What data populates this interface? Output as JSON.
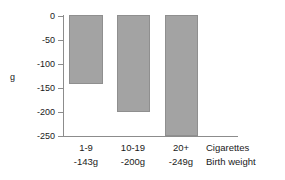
{
  "chart_data": {
    "type": "bar",
    "title": "",
    "xlabel": "Cigarettes",
    "ylabel": "g",
    "categories": [
      "1-9",
      "10-19",
      "20+"
    ],
    "values": [
      -143,
      -200,
      -249
    ],
    "value_labels": [
      "-143g",
      "-200g",
      "-249g"
    ],
    "series": [
      {
        "name": "Birth weight",
        "values": [
          -143,
          -200,
          -249
        ]
      }
    ],
    "ylim": [
      -250,
      0
    ],
    "yticks": [
      0,
      -50,
      -100,
      -150,
      -200,
      -250
    ],
    "ytick_labels": [
      "0",
      "-50",
      "-100",
      "-150",
      "-200",
      "-250"
    ],
    "grid": false,
    "legend": "none",
    "bar_color": "#a3a3a3",
    "bar_border_color": "#8f8f8f",
    "axis_color": "#8c8c8c"
  },
  "axes": {
    "y_title": "g",
    "y_ticks": [
      {
        "label": "0",
        "value": 0
      },
      {
        "label": "-50",
        "value": -50
      },
      {
        "label": "-100",
        "value": -100
      },
      {
        "label": "-150",
        "value": -150
      },
      {
        "label": "-200",
        "value": -200
      },
      {
        "label": "-250",
        "value": -250
      }
    ]
  },
  "categories": [
    {
      "name": "1-9",
      "value_label": "-143g"
    },
    {
      "name": "10-19",
      "value_label": "-200g"
    },
    {
      "name": "20+",
      "value_label": "-249g"
    }
  ],
  "row_legend": {
    "row1": "Cigarettes",
    "row2": "Birth weight"
  }
}
